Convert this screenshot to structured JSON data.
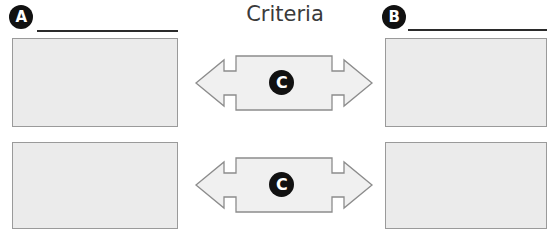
{
  "title": "Criteria",
  "columns": [
    {
      "marker": "A",
      "marker_icon": "circle-letter-a-icon",
      "rule_icon": "write-on-line-rule",
      "boxes": [
        {
          "content": ""
        },
        {
          "content": ""
        }
      ]
    },
    {
      "marker": "B",
      "marker_icon": "circle-letter-b-icon",
      "rule_icon": "write-on-line-rule",
      "boxes": [
        {
          "content": ""
        },
        {
          "content": ""
        }
      ]
    }
  ],
  "connectors": [
    {
      "badge": "C",
      "badge_icon": "circle-letter-c-icon",
      "icon": "left-right-double-arrow-icon",
      "content": ""
    },
    {
      "badge": "C",
      "badge_icon": "circle-letter-c-icon",
      "icon": "left-right-double-arrow-icon",
      "content": ""
    }
  ],
  "colors": {
    "page_background": "#ffffff",
    "box_fill": "#ebebeb",
    "box_border": "#9a9a9a",
    "arrow_fill": "#f0f0f0",
    "arrow_border": "#8c8c8c",
    "badge_fill": "#111111",
    "badge_text": "#ffffff",
    "rule": "#2b2b2b",
    "title_text": "#3a3a3a"
  }
}
